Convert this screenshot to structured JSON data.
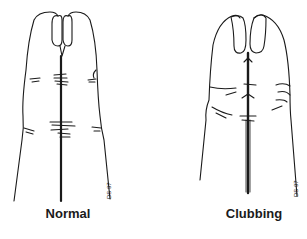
{
  "figure": {
    "panels": [
      {
        "id": "normal",
        "label": "Normal",
        "signature": "DS 97"
      },
      {
        "id": "clubbing",
        "label": "Clubbing",
        "signature": "DS 97"
      }
    ]
  },
  "colors": {
    "ink": "#1a1a1a",
    "background": "#ffffff"
  }
}
